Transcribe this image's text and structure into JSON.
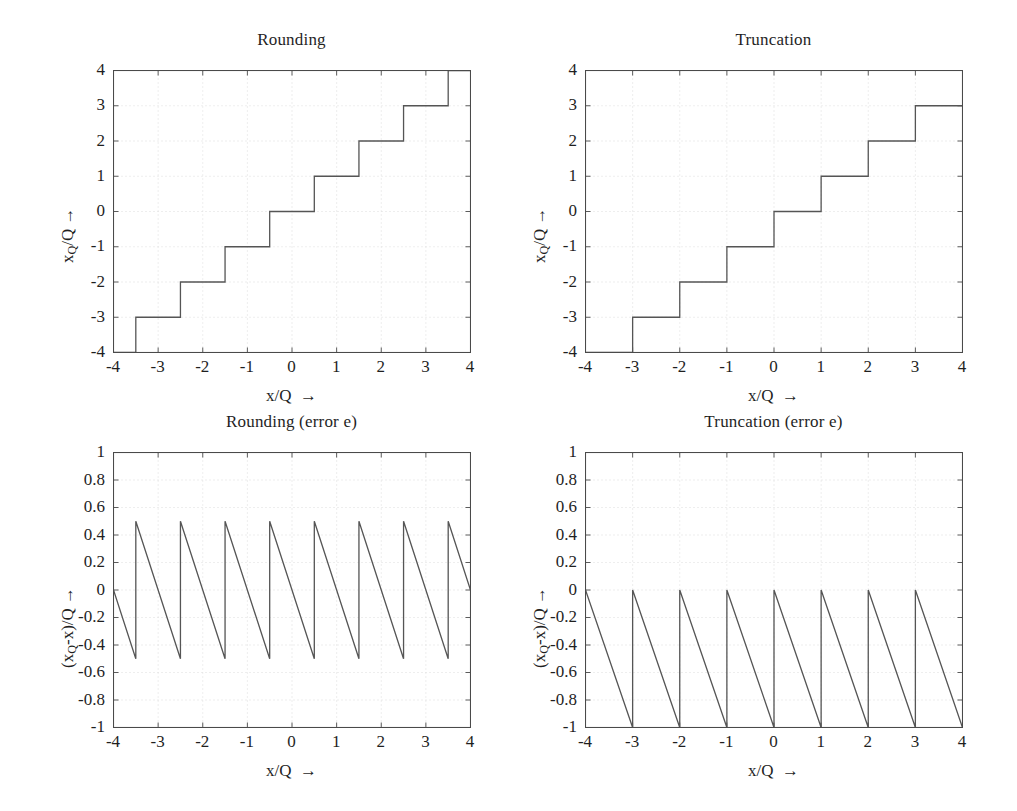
{
  "figure": {
    "background_color": "#ffffff",
    "line_color": "#555555",
    "axis_color": "#4a4a4a",
    "grid_color": "#d9d9d9",
    "text_color": "#1f1f1f"
  },
  "panels": [
    {
      "id": "rounding-quantizer",
      "title": "Rounding",
      "xlabel_main": "x/Q",
      "xlabel_arrow": "→",
      "ylabel_pre": "x",
      "ylabel_sub": "Q",
      "ylabel_post": "/Q",
      "ylabel_arrow": "→",
      "xticks": [
        "-4",
        "-3",
        "-2",
        "-1",
        "0",
        "1",
        "2",
        "3",
        "4"
      ],
      "yticks": [
        "4",
        "3",
        "2",
        "1",
        "0",
        "-1",
        "-2",
        "-3",
        "-4"
      ]
    },
    {
      "id": "truncation-quantizer",
      "title": "Truncation",
      "xlabel_main": "x/Q",
      "xlabel_arrow": "→",
      "ylabel_pre": "x",
      "ylabel_sub": "Q",
      "ylabel_post": "/Q",
      "ylabel_arrow": "→",
      "xticks": [
        "-4",
        "-3",
        "-2",
        "-1",
        "0",
        "1",
        "2",
        "3",
        "4"
      ],
      "yticks": [
        "4",
        "3",
        "2",
        "1",
        "0",
        "-1",
        "-2",
        "-3",
        "-4"
      ]
    },
    {
      "id": "rounding-error",
      "title": "Rounding (error e)",
      "xlabel_main": "x/Q",
      "xlabel_arrow": "→",
      "ylabel_pre": "(x",
      "ylabel_sub": "Q",
      "ylabel_post": "-x)/Q",
      "ylabel_arrow": "→",
      "xticks": [
        "-4",
        "-3",
        "-2",
        "-1",
        "0",
        "1",
        "2",
        "3",
        "4"
      ],
      "yticks": [
        "1",
        "0.8",
        "0.6",
        "0.4",
        "0.2",
        "0",
        "-0.2",
        "-0.4",
        "-0.6",
        "-0.8",
        "-1"
      ]
    },
    {
      "id": "truncation-error",
      "title": "Truncation (error e)",
      "xlabel_main": "x/Q",
      "xlabel_arrow": "→",
      "ylabel_pre": "(x",
      "ylabel_sub": "Q",
      "ylabel_post": "-x)/Q",
      "ylabel_arrow": "→",
      "xticks": [
        "-4",
        "-3",
        "-2",
        "-1",
        "0",
        "1",
        "2",
        "3",
        "4"
      ],
      "yticks": [
        "1",
        "0.8",
        "0.6",
        "0.4",
        "0.2",
        "0",
        "-0.2",
        "-0.4",
        "-0.6",
        "-0.8",
        "-1"
      ]
    }
  ],
  "chart_data": [
    {
      "type": "line",
      "id": "rounding-quantizer",
      "title": "Rounding",
      "xlabel": "x/Q →",
      "ylabel": "xQ/Q →",
      "xlim": [
        -4,
        4
      ],
      "ylim": [
        -4,
        4
      ],
      "xticks": [
        -4,
        -3,
        -2,
        -1,
        0,
        1,
        2,
        3,
        4
      ],
      "yticks": [
        -4,
        -3,
        -2,
        -1,
        0,
        1,
        2,
        3,
        4
      ],
      "grid": true,
      "legend": null,
      "description": "Staircase: xQ/Q = round(x/Q); transitions at half-integers",
      "x": [
        -4,
        -3.5,
        -3.5,
        -2.5,
        -2.5,
        -1.5,
        -1.5,
        -0.5,
        -0.5,
        0.5,
        0.5,
        1.5,
        1.5,
        2.5,
        2.5,
        3.5,
        3.5,
        4
      ],
      "y": [
        -4,
        -4,
        -3,
        -3,
        -2,
        -2,
        -1,
        -1,
        0,
        0,
        1,
        1,
        2,
        2,
        3,
        3,
        4,
        4
      ]
    },
    {
      "type": "line",
      "id": "truncation-quantizer",
      "title": "Truncation",
      "xlabel": "x/Q →",
      "ylabel": "xQ/Q →",
      "xlim": [
        -4,
        4
      ],
      "ylim": [
        -4,
        4
      ],
      "xticks": [
        -4,
        -3,
        -2,
        -1,
        0,
        1,
        2,
        3,
        4
      ],
      "yticks": [
        -4,
        -3,
        -2,
        -1,
        0,
        1,
        2,
        3,
        4
      ],
      "grid": true,
      "legend": null,
      "description": "Staircase: xQ/Q = floor(x/Q); transitions at integers",
      "x": [
        -4,
        -3,
        -3,
        -2,
        -2,
        -1,
        -1,
        0,
        0,
        1,
        1,
        2,
        2,
        3,
        3,
        4
      ],
      "y": [
        -4,
        -4,
        -3,
        -3,
        -2,
        -2,
        -1,
        -1,
        0,
        0,
        1,
        1,
        2,
        2,
        3,
        3
      ]
    },
    {
      "type": "line",
      "id": "rounding-error",
      "title": "Rounding (error e)",
      "xlabel": "x/Q →",
      "ylabel": "(xQ-x)/Q →",
      "xlim": [
        -4,
        4
      ],
      "ylim": [
        -1,
        1
      ],
      "xticks": [
        -4,
        -3,
        -2,
        -1,
        0,
        1,
        2,
        3,
        4
      ],
      "yticks": [
        -1,
        -0.8,
        -0.6,
        -0.4,
        -0.2,
        0,
        0.2,
        0.4,
        0.6,
        0.8,
        1
      ],
      "grid": true,
      "legend": null,
      "description": "Sawtooth error of rounding, ranging from -0.5 to +0.5, period 1, 8 teeth",
      "peak": 0.5,
      "trough": -0.5,
      "period": 1,
      "teeth": 8,
      "x": [
        -4,
        -3.5,
        -3.5,
        -2.5,
        -2.5,
        -1.5,
        -1.5,
        -0.5,
        -0.5,
        0.5,
        0.5,
        1.5,
        1.5,
        2.5,
        2.5,
        3.5,
        3.5,
        4
      ],
      "y": [
        0,
        -0.5,
        0.5,
        -0.5,
        0.5,
        -0.5,
        0.5,
        -0.5,
        0.5,
        -0.5,
        0.5,
        -0.5,
        0.5,
        -0.5,
        0.5,
        -0.5,
        0.5,
        0
      ]
    },
    {
      "type": "line",
      "id": "truncation-error",
      "title": "Truncation (error e)",
      "xlabel": "x/Q →",
      "ylabel": "(xQ-x)/Q →",
      "xlim": [
        -4,
        4
      ],
      "ylim": [
        -1,
        1
      ],
      "xticks": [
        -4,
        -3,
        -2,
        -1,
        0,
        1,
        2,
        3,
        4
      ],
      "yticks": [
        -1,
        -0.8,
        -0.6,
        -0.4,
        -0.2,
        0,
        0.2,
        0.4,
        0.6,
        0.8,
        1
      ],
      "grid": true,
      "legend": null,
      "description": "Sawtooth error of truncation, ranging from -1 to 0, period 1, 8 teeth",
      "peak": 0,
      "trough": -1,
      "period": 1,
      "teeth": 8,
      "x": [
        -4,
        -3,
        -3,
        -2,
        -2,
        -1,
        -1,
        0,
        0,
        1,
        1,
        2,
        2,
        3,
        3,
        4
      ],
      "y": [
        0,
        -1,
        0,
        -1,
        0,
        -1,
        0,
        -1,
        0,
        -1,
        0,
        -1,
        0,
        -1,
        0,
        -1
      ]
    }
  ]
}
